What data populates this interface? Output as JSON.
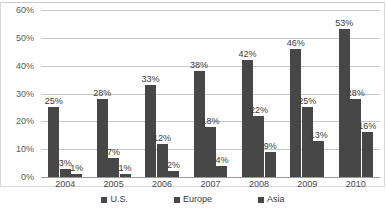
{
  "chart_data": {
    "type": "bar",
    "title": "",
    "subtitle": "",
    "xlabel": "",
    "ylabel": "",
    "categories": [
      "2004",
      "2005",
      "2006",
      "2007",
      "2008",
      "2009",
      "2010"
    ],
    "series": [
      {
        "name": "U.S.",
        "values": [
          25,
          28,
          33,
          38,
          42,
          46,
          53
        ],
        "labels": [
          "25%",
          "28%",
          "33%",
          "38%",
          "42%",
          "46%",
          "53%"
        ],
        "color": "#474747"
      },
      {
        "name": "Europe",
        "values": [
          3,
          7,
          12,
          18,
          22,
          25,
          28
        ],
        "labels": [
          "3%",
          "7%",
          "12%",
          "18%",
          "22%",
          "25%",
          "28%"
        ],
        "color": "#474747"
      },
      {
        "name": "Asia",
        "values": [
          1,
          1,
          2,
          4,
          9,
          13,
          16
        ],
        "labels": [
          "1%",
          "1%",
          "2%",
          "4%",
          "9%",
          "13%",
          "16%"
        ],
        "color": "#474747"
      }
    ],
    "ylim": [
      0,
      60
    ],
    "ytick_values": [
      0,
      10,
      20,
      30,
      40,
      50,
      60
    ],
    "ytick_labels": [
      "0%",
      "10%",
      "20%",
      "30%",
      "40%",
      "50%",
      "60%"
    ],
    "grid": true,
    "grid_color": "#c8c8c8",
    "legend_position": "bottom",
    "data_labels": true,
    "background_color": "#ffffff",
    "border_color": "#d9d9d9"
  },
  "legend": {
    "items": [
      {
        "label": "U.S."
      },
      {
        "label": "Europe"
      },
      {
        "label": "Asia"
      }
    ]
  }
}
